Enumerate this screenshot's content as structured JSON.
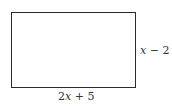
{
  "diagram": {
    "shape": "rectangle",
    "side_labels": {
      "right": {
        "variable": "x",
        "op": " − ",
        "constant": "2",
        "full": "x − 2"
      },
      "bottom": {
        "coef": "2",
        "variable": "x",
        "op": " + ",
        "constant": "5",
        "full": "2x + 5"
      }
    }
  }
}
